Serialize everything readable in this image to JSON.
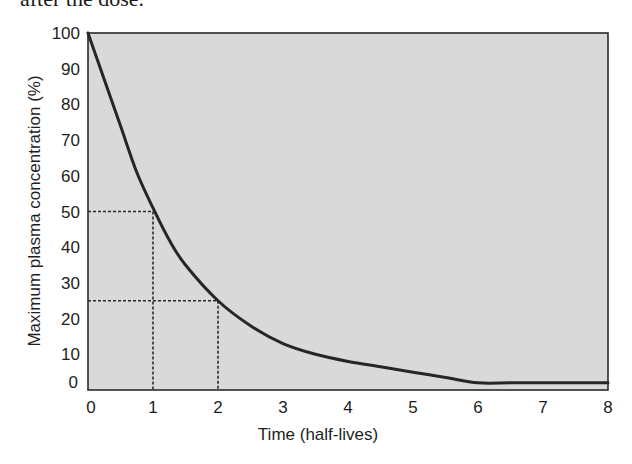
{
  "page": {
    "caption_fragment": "after the dose."
  },
  "colors": {
    "plot_background": "#d9d9d9",
    "frame": "#2a2a2a",
    "curve": "#262626",
    "guides": "#2a2a2a",
    "text": "#1e1e1e"
  },
  "chart_data": {
    "type": "line",
    "title": "",
    "xlabel": "Time (half-lives)",
    "ylabel": "Maximum plasma concentration (%)",
    "xlim": [
      0,
      8
    ],
    "ylim": [
      0,
      100
    ],
    "x_ticks": [
      0,
      1,
      2,
      3,
      4,
      5,
      6,
      7,
      8
    ],
    "y_ticks": [
      0,
      10,
      20,
      30,
      40,
      50,
      60,
      70,
      80,
      90,
      100
    ],
    "grid": false,
    "legend": null,
    "series": [
      {
        "name": "Plasma concentration",
        "x": [
          0,
          0.25,
          0.5,
          0.75,
          1,
          1.25,
          1.5,
          2,
          2.5,
          3,
          3.5,
          4,
          4.5,
          5,
          5.5,
          6,
          6.5,
          7,
          7.5,
          8
        ],
        "values": [
          100,
          87,
          74,
          61,
          51,
          42,
          35,
          25,
          18,
          13,
          10,
          8,
          6.5,
          5,
          3.5,
          2,
          2,
          2,
          2,
          2
        ]
      }
    ],
    "annotations": [
      {
        "type": "dashed-guide",
        "from": [
          0,
          50
        ],
        "to": [
          1,
          50
        ],
        "drop_to": [
          1,
          0
        ],
        "label": "50% at 1 half-life"
      },
      {
        "type": "dashed-guide",
        "from": [
          0,
          25
        ],
        "to": [
          2,
          25
        ],
        "drop_to": [
          2,
          0
        ],
        "label": "25% at 2 half-lives"
      }
    ]
  }
}
